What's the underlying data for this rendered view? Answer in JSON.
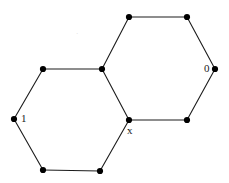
{
  "figure": {
    "type": "graph-diagram",
    "width": 229,
    "height": 183,
    "background_color": "#ffffff",
    "edge_color": "#1c1c1c",
    "edge_width": 1.1,
    "vertex_color": "#000000",
    "vertex_radius": 3.1
  },
  "chart_data": {
    "type": "scatter",
    "title": "",
    "xlabel": "",
    "ylabel": "",
    "xlim": [
      0,
      229
    ],
    "ylim": [
      183,
      0
    ],
    "grid": false,
    "legend": "none",
    "nodes": [
      {
        "id": "v1",
        "x": 14,
        "y": 119,
        "label": "1"
      },
      {
        "id": "v2",
        "x": 43,
        "y": 69,
        "label": ""
      },
      {
        "id": "v3",
        "x": 102,
        "y": 69,
        "label": ""
      },
      {
        "id": "v4",
        "x": 129,
        "y": 120,
        "label": "x"
      },
      {
        "id": "v5",
        "x": 100,
        "y": 171,
        "label": ""
      },
      {
        "id": "v6",
        "x": 43,
        "y": 170,
        "label": ""
      },
      {
        "id": "v7",
        "x": 129,
        "y": 17,
        "label": ""
      },
      {
        "id": "v8",
        "x": 187,
        "y": 17,
        "label": ""
      },
      {
        "id": "v9",
        "x": 215,
        "y": 69,
        "label": "0"
      },
      {
        "id": "v10",
        "x": 187,
        "y": 120,
        "label": ""
      }
    ],
    "edges": [
      {
        "from": "v1",
        "to": "v2"
      },
      {
        "from": "v2",
        "to": "v3"
      },
      {
        "from": "v3",
        "to": "v4"
      },
      {
        "from": "v4",
        "to": "v5"
      },
      {
        "from": "v5",
        "to": "v6"
      },
      {
        "from": "v6",
        "to": "v1"
      },
      {
        "from": "v3",
        "to": "v7"
      },
      {
        "from": "v7",
        "to": "v8"
      },
      {
        "from": "v8",
        "to": "v9"
      },
      {
        "from": "v9",
        "to": "v10"
      },
      {
        "from": "v10",
        "to": "v4"
      }
    ]
  },
  "labels": {
    "left_vertex": "1",
    "right_vertex": "0",
    "junction_vertex": "x",
    "faint_mark": "·"
  }
}
